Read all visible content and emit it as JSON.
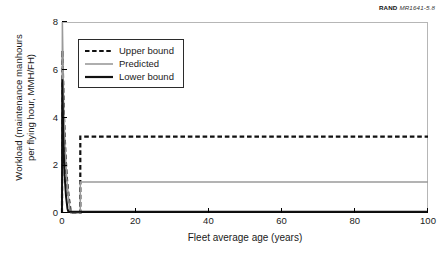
{
  "source_credit": {
    "organization": "RAND",
    "document_id": "MR1641-5.8"
  },
  "chart_data": {
    "type": "line",
    "title": "",
    "subtitle": "",
    "xlabel": "Fleet average age (years)",
    "ylabel": "Workload (maintenance manhours\nper flying hour, MMH/FH)",
    "xlim": [
      0,
      100
    ],
    "ylim": [
      0,
      8
    ],
    "xticks": [
      0,
      20,
      40,
      60,
      80,
      100
    ],
    "yticks": [
      0,
      2,
      4,
      6,
      8
    ],
    "xtick_labels": [
      "0",
      "20",
      "40",
      "60",
      "80",
      "100"
    ],
    "ytick_labels": [
      "0",
      "2",
      "4",
      "6",
      "8"
    ],
    "grid": false,
    "legend_position": "upper-left-inside",
    "series": [
      {
        "name": "Upper bound",
        "style": "dashed",
        "color": "#111111",
        "width": 2.2,
        "points": [
          [
            0.0,
            0.0
          ],
          [
            0.12,
            6.8
          ],
          [
            0.5,
            4.2
          ],
          [
            0.9,
            2.6
          ],
          [
            1.3,
            1.5
          ],
          [
            1.8,
            0.7
          ],
          [
            2.3,
            0.15
          ],
          [
            2.55,
            0.0
          ],
          [
            5.0,
            0.0
          ],
          [
            5.0,
            3.2
          ],
          [
            100.0,
            3.2
          ]
        ]
      },
      {
        "name": "Predicted",
        "style": "solid",
        "color": "#9a9a9a",
        "width": 1.5,
        "points": [
          [
            0.0,
            0.0
          ],
          [
            0.1,
            8.0
          ],
          [
            0.45,
            4.6
          ],
          [
            0.85,
            2.7
          ],
          [
            1.3,
            1.45
          ],
          [
            1.8,
            0.6
          ],
          [
            2.2,
            0.12
          ],
          [
            2.4,
            0.0
          ],
          [
            5.0,
            0.0
          ],
          [
            5.0,
            1.3
          ],
          [
            100.0,
            1.3
          ]
        ]
      },
      {
        "name": "Lower bound",
        "style": "solid",
        "color": "#111111",
        "width": 2.0,
        "points": [
          [
            0.0,
            0.0
          ],
          [
            0.08,
            5.6
          ],
          [
            0.35,
            3.1
          ],
          [
            0.7,
            1.6
          ],
          [
            1.1,
            0.7
          ],
          [
            1.5,
            0.18
          ],
          [
            1.75,
            0.05
          ],
          [
            100.0,
            0.05
          ]
        ]
      }
    ],
    "annotations": [],
    "plateau_values": {
      "upper_bound": 3.2,
      "predicted": 1.3,
      "lower_bound": 0.05
    },
    "peak_values": {
      "upper_bound": 6.8,
      "predicted": 8.0,
      "lower_bound": 5.6
    }
  },
  "legend": {
    "entries": [
      {
        "label": "Upper bound"
      },
      {
        "label": "Predicted"
      },
      {
        "label": "Lower bound"
      }
    ]
  }
}
